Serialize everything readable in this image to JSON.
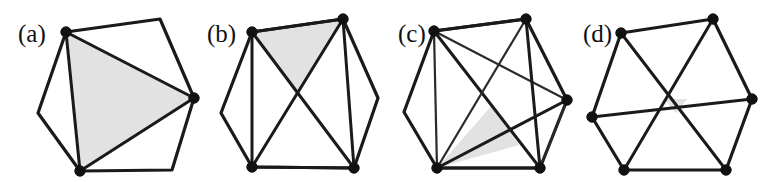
{
  "figure": {
    "width": 780,
    "height": 182,
    "background_color": "#ffffff",
    "line_color": "#1a1a1a",
    "shade_color": "#e2e2e2",
    "vertex_color": "#111111"
  },
  "panels": [
    {
      "id": "a",
      "label": "(a)",
      "label_x": 18,
      "label_y": 42,
      "hexagon": [
        [
          66,
          32
        ],
        [
          160,
          19
        ],
        [
          194,
          98
        ],
        [
          172,
          170
        ],
        [
          80,
          171
        ],
        [
          38,
          113
        ]
      ],
      "marked_vertices": [
        [
          66,
          32
        ],
        [
          194,
          98
        ],
        [
          80,
          171
        ]
      ],
      "chords": [
        [
          [
            66,
            32
          ],
          [
            194,
            98
          ]
        ],
        [
          [
            194,
            98
          ],
          [
            80,
            171
          ]
        ],
        [
          [
            66,
            32
          ],
          [
            80,
            171
          ]
        ]
      ],
      "shaded_triangle": [
        [
          66,
          32
        ],
        [
          194,
          98
        ],
        [
          80,
          171
        ]
      ],
      "marked_count": 3,
      "chord_count": 3
    },
    {
      "id": "b",
      "label": "(b)",
      "label_x": 207,
      "label_y": 42,
      "hexagon": [
        [
          252,
          32
        ],
        [
          343,
          19
        ],
        [
          378,
          98
        ],
        [
          354,
          168
        ],
        [
          252,
          167
        ],
        [
          221,
          113
        ]
      ],
      "marked_vertices": [
        [
          252,
          32
        ],
        [
          343,
          19
        ],
        [
          354,
          168
        ],
        [
          252,
          167
        ]
      ],
      "chords": [
        [
          [
            252,
            32
          ],
          [
            343,
            19
          ]
        ],
        [
          [
            252,
            32
          ],
          [
            354,
            168
          ]
        ],
        [
          [
            343,
            19
          ],
          [
            252,
            167
          ]
        ],
        [
          [
            252,
            32
          ],
          [
            252,
            167
          ]
        ],
        [
          [
            343,
            19
          ],
          [
            354,
            168
          ]
        ],
        [
          [
            252,
            167
          ],
          [
            354,
            168
          ]
        ]
      ],
      "shaded_triangle": [
        [
          252,
          32
        ],
        [
          343,
          19
        ],
        [
          297,
          96
        ]
      ],
      "marked_count": 4,
      "chord_count": 6
    },
    {
      "id": "c",
      "label": "(c)",
      "label_x": 398,
      "label_y": 42,
      "hexagon": [
        [
          434,
          31
        ],
        [
          526,
          19
        ],
        [
          567,
          100
        ],
        [
          540,
          168
        ],
        [
          437,
          168
        ],
        [
          404,
          112
        ]
      ],
      "marked_vertices": [
        [
          434,
          31
        ],
        [
          526,
          19
        ],
        [
          567,
          100
        ],
        [
          540,
          168
        ],
        [
          437,
          168
        ]
      ],
      "chords": [
        [
          [
            434,
            31
          ],
          [
            526,
            19
          ]
        ],
        [
          [
            434,
            31
          ],
          [
            567,
            100
          ]
        ],
        [
          [
            434,
            31
          ],
          [
            540,
            168
          ]
        ],
        [
          [
            434,
            31
          ],
          [
            437,
            168
          ]
        ],
        [
          [
            526,
            19
          ],
          [
            540,
            168
          ]
        ],
        [
          [
            526,
            19
          ],
          [
            437,
            168
          ]
        ],
        [
          [
            567,
            100
          ],
          [
            437,
            168
          ]
        ],
        [
          [
            567,
            100
          ],
          [
            540,
            168
          ]
        ],
        [
          [
            540,
            168
          ],
          [
            437,
            168
          ]
        ]
      ],
      "shaded_triangle": [
        [
          437,
          168
        ],
        [
          492,
          105
        ],
        [
          519,
          145
        ]
      ],
      "marked_count": 5,
      "chord_count": 9
    },
    {
      "id": "d",
      "label": "(d)",
      "label_x": 583,
      "label_y": 42,
      "hexagon": [
        [
          621,
          33
        ],
        [
          713,
          19
        ],
        [
          752,
          99
        ],
        [
          726,
          170
        ],
        [
          624,
          170
        ],
        [
          592,
          117
        ]
      ],
      "marked_vertices": [
        [
          621,
          33
        ],
        [
          713,
          19
        ],
        [
          752,
          99
        ],
        [
          726,
          170
        ],
        [
          624,
          170
        ],
        [
          592,
          117
        ]
      ],
      "chords": [
        [
          [
            621,
            33
          ],
          [
            726,
            170
          ]
        ],
        [
          [
            713,
            19
          ],
          [
            624,
            170
          ]
        ],
        [
          [
            592,
            117
          ],
          [
            752,
            99
          ]
        ]
      ],
      "shaded_triangle": [
        [
          664,
          99
        ],
        [
          687,
          99
        ],
        [
          676,
          113
        ]
      ],
      "marked_count": 6,
      "chord_count": 3
    }
  ]
}
